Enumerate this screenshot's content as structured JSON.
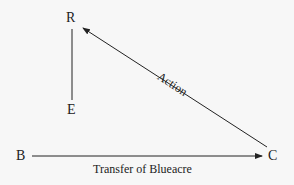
{
  "diagram": {
    "nodes": {
      "R": "R",
      "E": "E",
      "B": "B",
      "C": "C"
    },
    "edges": {
      "action": "Action",
      "transfer": "Transfer of Blueacre"
    }
  }
}
